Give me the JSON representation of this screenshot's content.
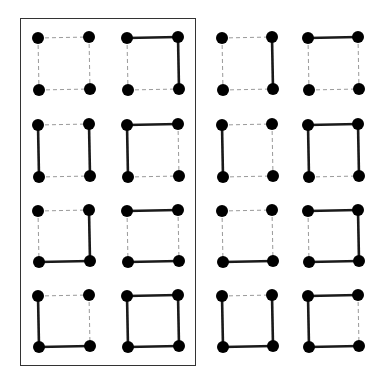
{
  "colors": {
    "node": "#000000",
    "solid_edge": "#1a1a1a",
    "dashed_edge": "#9a9a9a",
    "frame": "#333333",
    "background": "#ffffff"
  },
  "frame": {
    "x": 20,
    "y": 18,
    "width": 176,
    "height": 348,
    "contains_columns": [
      0,
      1
    ]
  },
  "layout": {
    "column_x": [
      [
        38,
        89
      ],
      [
        127,
        178
      ],
      [
        222,
        272
      ],
      [
        308,
        358
      ]
    ],
    "row_y": [
      [
        38,
        90
      ],
      [
        125,
        177
      ],
      [
        211,
        262
      ],
      [
        296,
        347
      ]
    ],
    "node_radius": 6
  },
  "squares": [
    {
      "row": 0,
      "col": 0,
      "edges": {
        "top": false,
        "right": false,
        "bottom": false,
        "left": false
      }
    },
    {
      "row": 0,
      "col": 1,
      "edges": {
        "top": true,
        "right": true,
        "bottom": false,
        "left": false
      }
    },
    {
      "row": 0,
      "col": 2,
      "edges": {
        "top": false,
        "right": true,
        "bottom": false,
        "left": false
      }
    },
    {
      "row": 0,
      "col": 3,
      "edges": {
        "top": true,
        "right": false,
        "bottom": false,
        "left": false
      }
    },
    {
      "row": 1,
      "col": 0,
      "edges": {
        "top": false,
        "right": true,
        "bottom": false,
        "left": true
      }
    },
    {
      "row": 1,
      "col": 1,
      "edges": {
        "top": true,
        "right": false,
        "bottom": false,
        "left": true
      }
    },
    {
      "row": 1,
      "col": 2,
      "edges": {
        "top": false,
        "right": false,
        "bottom": false,
        "left": true
      }
    },
    {
      "row": 1,
      "col": 3,
      "edges": {
        "top": true,
        "right": true,
        "bottom": false,
        "left": true
      }
    },
    {
      "row": 2,
      "col": 0,
      "edges": {
        "top": false,
        "right": true,
        "bottom": true,
        "left": false
      }
    },
    {
      "row": 2,
      "col": 1,
      "edges": {
        "top": true,
        "right": false,
        "bottom": true,
        "left": false
      }
    },
    {
      "row": 2,
      "col": 2,
      "edges": {
        "top": false,
        "right": false,
        "bottom": true,
        "left": false
      }
    },
    {
      "row": 2,
      "col": 3,
      "edges": {
        "top": true,
        "right": true,
        "bottom": true,
        "left": false
      }
    },
    {
      "row": 3,
      "col": 0,
      "edges": {
        "top": false,
        "right": false,
        "bottom": true,
        "left": true
      }
    },
    {
      "row": 3,
      "col": 1,
      "edges": {
        "top": true,
        "right": true,
        "bottom": true,
        "left": true
      }
    },
    {
      "row": 3,
      "col": 2,
      "edges": {
        "top": false,
        "right": true,
        "bottom": true,
        "left": true
      }
    },
    {
      "row": 3,
      "col": 3,
      "edges": {
        "top": true,
        "right": false,
        "bottom": true,
        "left": true
      }
    }
  ]
}
